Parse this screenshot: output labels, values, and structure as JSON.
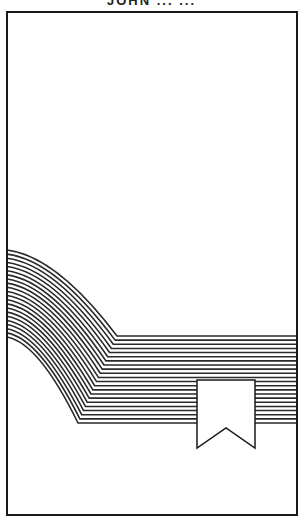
{
  "header": {
    "title_partial": "JOHN ...  ..."
  },
  "illustration": {
    "frame": {
      "x": 7,
      "y": 12,
      "width": 290,
      "height": 503,
      "stroke": "#1a1a1a"
    },
    "band": {
      "stripe_count": 22,
      "stripe_color": "#2a2a2a",
      "top_left_y": 250,
      "bottom_left_y": 337,
      "top_bend": {
        "x": 117,
        "y": 336
      },
      "bottom_bend": {
        "x": 78,
        "y": 423
      },
      "right_x": 297
    },
    "bookmark": {
      "x": 197,
      "y": 380,
      "width": 58,
      "height": 68,
      "notch_depth": 20,
      "fill": "#ffffff",
      "stroke": "#1a1a1a"
    }
  }
}
